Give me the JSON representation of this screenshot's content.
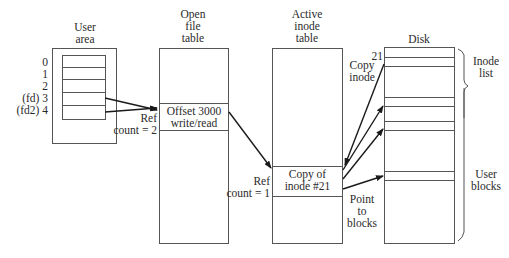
{
  "diagram": {
    "user_area": {
      "title_line1": "User",
      "title_line2": "area",
      "rows": [
        "0",
        "1",
        "2",
        "(fd) 3",
        "(fd2) 4"
      ]
    },
    "open_file_table": {
      "title_line1": "Open",
      "title_line2": "file",
      "title_line3": "table",
      "entry_line1": "Offset 3000",
      "entry_line2": "write/read",
      "ref_line1": "Ref",
      "ref_line2": "count = 2"
    },
    "active_inode_table": {
      "title_line1": "Active",
      "title_line2": "inode",
      "title_line3": "table",
      "entry_line1": "Copy of",
      "entry_line2": "inode #21",
      "ref_line1": "Ref",
      "ref_line2": "count = 1"
    },
    "disk": {
      "title": "Disk",
      "inode_number": "21",
      "copy_label_line1": "Copy",
      "copy_label_line2": "inode",
      "point_label_line1": "Point",
      "point_label_line2": "to",
      "point_label_line3": "blocks",
      "inode_list_line1": "Inode",
      "inode_list_line2": "list",
      "user_blocks_line1": "User",
      "user_blocks_line2": "blocks"
    }
  }
}
